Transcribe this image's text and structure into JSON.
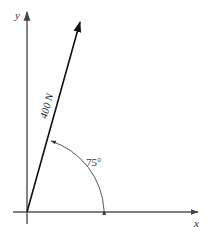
{
  "diagram": {
    "type": "force-vector",
    "axes": {
      "x_label": "x",
      "y_label": "y"
    },
    "force": {
      "label": "400 N",
      "magnitude": 400,
      "unit": "N",
      "angle_deg": 75,
      "reference": "positive x-axis"
    },
    "angle_label": "75°",
    "colors": {
      "axis": "#555555",
      "force": "#111111",
      "arc": "#444444",
      "background": "#ffffff"
    }
  }
}
